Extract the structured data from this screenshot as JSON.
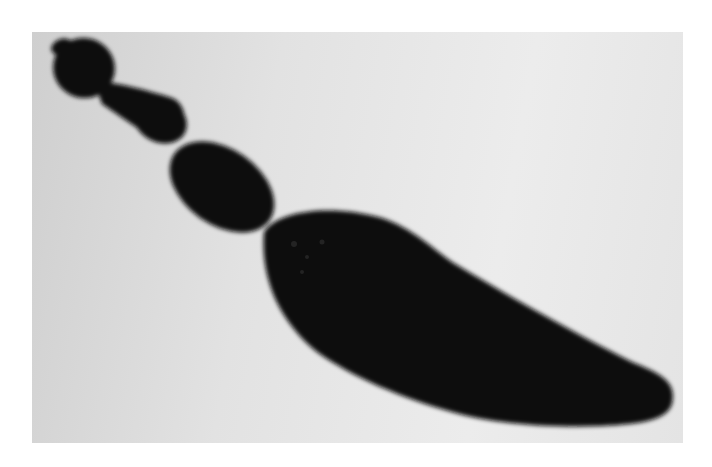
{
  "image": {
    "subject": "tapeworm micrograph",
    "alt": "Micrograph of a segmented tapeworm silhouette on a light gray background",
    "colors": {
      "page_background": "#ffffff",
      "photo_background_left": "#cfcfcf",
      "photo_background_right": "#ececec",
      "subject": "#0c0c0c"
    }
  }
}
